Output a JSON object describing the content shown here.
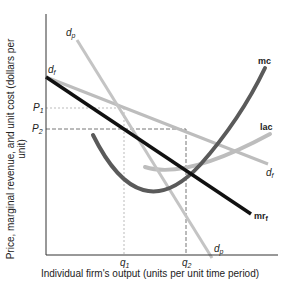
{
  "diagram": {
    "type": "economics-cost-revenue-diagram",
    "x_axis_label": "Individual firm's output (units per unit time period)",
    "y_axis_label": "Price, marginal revenue, and unit cost (dollars per unit)",
    "y_ticks": {
      "p1": "P",
      "p1_sub": "1",
      "p2": "P",
      "p2_sub": "2"
    },
    "x_ticks": {
      "q1": "q",
      "q1_sub": "1",
      "q2": "q",
      "q2_sub": "2"
    },
    "curves": {
      "mc": "mc",
      "lac": "lac",
      "df_base": "d",
      "df_sub": "f",
      "dp_base": "d",
      "dp_sub": "p",
      "mrf_base": "mr",
      "mrf_sub": "f"
    },
    "colors": {
      "axis": "#333333",
      "mrf": "#111111",
      "mc": "#5a5a5a",
      "lac": "#bdbdbd",
      "df": "#bdbdbd",
      "dp": "#c4c4c4",
      "guide": "#888888"
    }
  }
}
